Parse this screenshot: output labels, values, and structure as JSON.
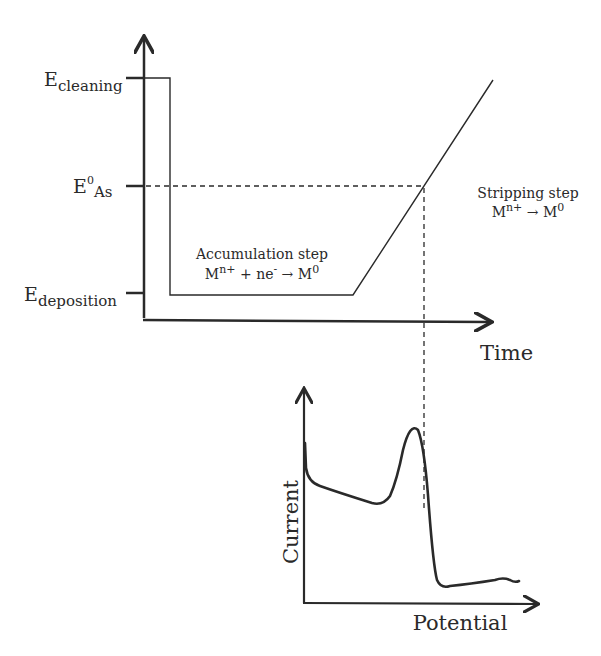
{
  "diagram": {
    "top_plot": {
      "x_axis_label": "Time",
      "y_tick_labels": [
        {
          "main": "E",
          "sub": "cleaning",
          "sup": ""
        },
        {
          "main": "E",
          "sub": "As",
          "sup": "0"
        },
        {
          "main": "E",
          "sub": "deposition",
          "sup": ""
        }
      ],
      "accumulation": {
        "title": "Accumulation step",
        "reaction_lhs": "M",
        "reaction_lhs_sup": "n+",
        "reaction_mid": " + ne",
        "reaction_mid_sup": "-",
        "arrow": " → ",
        "reaction_rhs": "M",
        "reaction_rhs_sup": "0"
      },
      "stripping": {
        "title": "Stripping step",
        "reaction_lhs": "M",
        "reaction_lhs_sup": "n+",
        "arrow": " → ",
        "reaction_rhs": "M",
        "reaction_rhs_sup": "0"
      }
    },
    "bottom_plot": {
      "x_axis_label": "Potential",
      "y_axis_label": "Current"
    }
  },
  "colors": {
    "line": "#2a2a2a",
    "background": "#ffffff"
  }
}
